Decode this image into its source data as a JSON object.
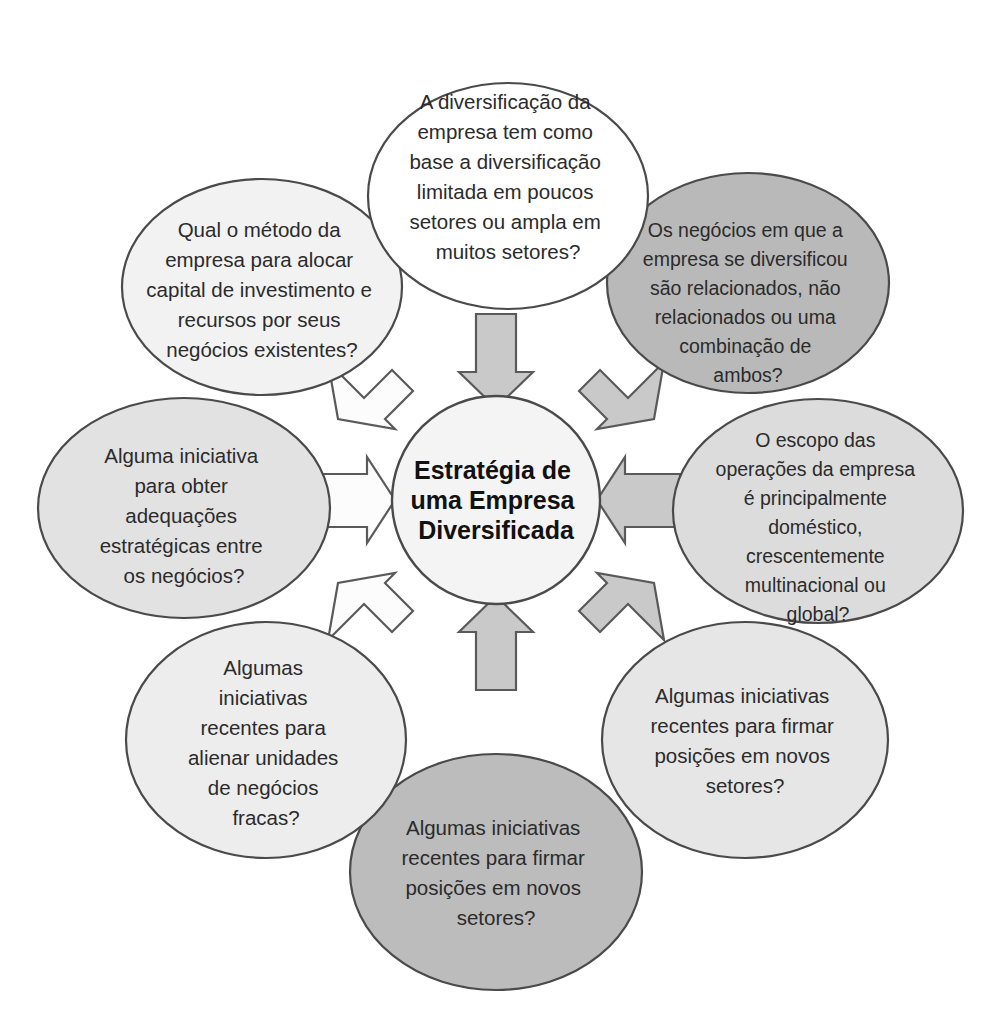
{
  "diagram": {
    "type": "hub-and-spoke",
    "title_center": {
      "lines": [
        "Estratégia de",
        "uma Empresa",
        "Diversificada"
      ],
      "full_text": "Estratégia de uma Empresa Diversificada",
      "fill_color": "#f4f4f4",
      "stroke_color": "#4a4a4a"
    },
    "palette": {
      "white": "#ffffff",
      "light_gray": "#e4e4e4",
      "lighter_gray": "#ececec",
      "medium_gray": "#b9b9b9",
      "outline": "#4a4a4a",
      "text": "#2b2b2b",
      "arrow_gray": "#c9c9c9",
      "arrow_white": "#fcfcfc",
      "arrow_stroke": "#5a5a5a"
    },
    "nodes": [
      {
        "id": "top",
        "position": "top",
        "fill_color": "#ffffff",
        "lines": [
          "A diversificação da",
          "empresa tem como",
          "base a diversificação",
          "limitada em poucos",
          "setores ou ampla em",
          "muitos setores?"
        ],
        "full_text": "A diversificação da empresa tem como base a diversificação limitada em poucos setores ou ampla em muitos setores?"
      },
      {
        "id": "top-right",
        "position": "top-right",
        "fill_color": "#b9b9b9",
        "lines": [
          "Os negócios em que a",
          "empresa se diversificou",
          "são relacionados, não",
          "relacionados ou uma",
          "combinação de",
          "ambos?"
        ],
        "full_text": "Os negócios em que a empresa se diversificou são relacionados, não relacionados ou uma combinação de ambos?"
      },
      {
        "id": "right",
        "position": "right",
        "fill_color": "#dcdcdc",
        "lines": [
          "O escopo das",
          "operações da empresa",
          "é principalmente",
          "doméstico,",
          "crescentemente",
          "multinacional ou",
          "global?"
        ],
        "full_text": "O escopo das operações da empresa é principalmente doméstico, crescentemente multinacional ou global?"
      },
      {
        "id": "bottom-right",
        "position": "bottom-right",
        "fill_color": "#e6e6e6",
        "lines": [
          "Algumas iniciativas",
          "recentes para firmar",
          "posições em novos",
          "setores?"
        ],
        "full_text": "Algumas iniciativas recentes para firmar posições em novos setores?"
      },
      {
        "id": "bottom",
        "position": "bottom",
        "fill_color": "#bcbcbc",
        "lines": [
          "Algumas iniciativas",
          "recentes para firmar",
          "posições em novos",
          "setores?"
        ],
        "full_text": "Algumas iniciativas recentes para firmar posições em novos setores?"
      },
      {
        "id": "bottom-left",
        "position": "bottom-left",
        "fill_color": "#ededed",
        "lines": [
          "Algumas",
          "iniciativas",
          "recentes para",
          "alienar unidades",
          "de negócios",
          "fracas?"
        ],
        "full_text": "Algumas iniciativas recentes para alienar unidades de negócios fracas?"
      },
      {
        "id": "left",
        "position": "left",
        "fill_color": "#e2e2e2",
        "lines": [
          "Alguma iniciativa",
          "para obter",
          "adequações",
          "estratégicas entre",
          "os negócios?"
        ],
        "full_text": "Alguma iniciativa para obter adequações estratégicas entre os negócios?"
      },
      {
        "id": "top-left",
        "position": "top-left",
        "fill_color": "#f2f2f2",
        "lines": [
          "Qual o método da",
          "empresa para alocar",
          "capital de investimento e",
          "recursos por seus",
          "negócios existentes?"
        ],
        "full_text": "Qual o método da empresa para alocar capital de investimento e recursos por seus negócios existentes?"
      }
    ],
    "arrows": [
      {
        "id": "arrow-top",
        "from": "top",
        "style": "filled"
      },
      {
        "id": "arrow-top-right",
        "from": "top-right",
        "style": "filled"
      },
      {
        "id": "arrow-right",
        "from": "right",
        "style": "filled"
      },
      {
        "id": "arrow-bottom-right",
        "from": "bottom-right",
        "style": "filled"
      },
      {
        "id": "arrow-bottom",
        "from": "bottom",
        "style": "filled"
      },
      {
        "id": "arrow-bottom-left",
        "from": "bottom-left",
        "style": "outline"
      },
      {
        "id": "arrow-left",
        "from": "left",
        "style": "outline"
      },
      {
        "id": "arrow-top-left",
        "from": "top-left",
        "style": "outline"
      }
    ]
  }
}
